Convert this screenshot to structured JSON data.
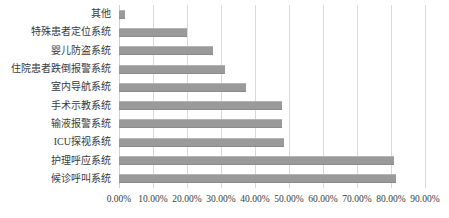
{
  "chart_data": {
    "type": "bar",
    "orientation": "horizontal",
    "title": "",
    "subtitle": "",
    "xlabel": "",
    "ylabel": "",
    "xlim": [
      0,
      0.9
    ],
    "grid": true,
    "legend": false,
    "legend_position": "none",
    "bar_color": "#9a9a9a",
    "gridline_color": "#d9d9d9",
    "tick_format": "percent-2dp",
    "categories": [
      "其他",
      "特殊患者定位系统",
      "婴儿防盗系统",
      "住院患者跌倒报警系统",
      "室内导航系统",
      "手术示教系统",
      "输液报警系统",
      "ICU探视系统",
      "护理呼应系统",
      "候诊呼叫系统"
    ],
    "values": [
      0.017,
      0.2,
      0.276,
      0.311,
      0.374,
      0.48,
      0.48,
      0.486,
      0.808,
      0.815
    ],
    "value_labels": [
      "1.70%",
      "20.00%",
      "27.60%",
      "31.10%",
      "37.40%",
      "48.00%",
      "48.00%",
      "48.60%",
      "80.80%",
      "81.50%"
    ],
    "xticks": [
      0,
      0.1,
      0.2,
      0.3,
      0.4,
      0.5,
      0.6,
      0.7,
      0.8,
      0.9
    ],
    "xtick_labels": [
      "0.00%",
      "10.00%",
      "20.00%",
      "30.00%",
      "40.00%",
      "50.00%",
      "60.00%",
      "70.00%",
      "80.00%",
      "90.00%"
    ]
  }
}
